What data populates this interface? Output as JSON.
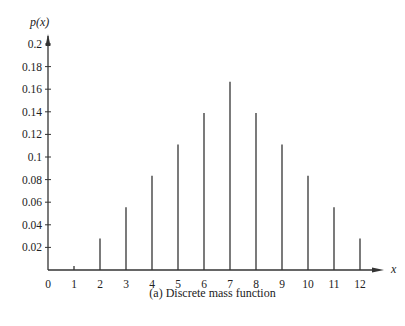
{
  "chart_data": {
    "type": "bar",
    "style": "stem",
    "title": "",
    "caption": "(a) Discrete mass function",
    "xlabel": "x",
    "ylabel": "p(x)",
    "categories": [
      0,
      1,
      2,
      3,
      4,
      5,
      6,
      7,
      8,
      9,
      10,
      11,
      12
    ],
    "values": [
      0,
      0,
      0.0278,
      0.0556,
      0.0833,
      0.1111,
      0.1389,
      0.1667,
      0.1389,
      0.1111,
      0.0833,
      0.0556,
      0.0278
    ],
    "x_ticks": [
      "0",
      "1",
      "2",
      "3",
      "4",
      "5",
      "6",
      "7",
      "8",
      "9",
      "10",
      "11",
      "12"
    ],
    "y_ticks": [
      "0.02",
      "0.04",
      "0.06",
      "0.08",
      "0.1",
      "0.12",
      "0.14",
      "0.16",
      "0.18",
      "0.2"
    ],
    "ylim": [
      0,
      0.21
    ],
    "xlim": [
      0,
      12.8
    ],
    "grid": false,
    "legend": null
  }
}
